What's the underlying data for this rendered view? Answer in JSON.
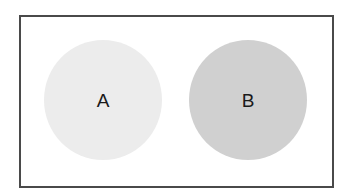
{
  "diagram": {
    "frame_border_color": "#4a4a4a",
    "circles": [
      {
        "label": "A",
        "fill": "#ececec"
      },
      {
        "label": "B",
        "fill": "#d0d0d0"
      }
    ]
  }
}
